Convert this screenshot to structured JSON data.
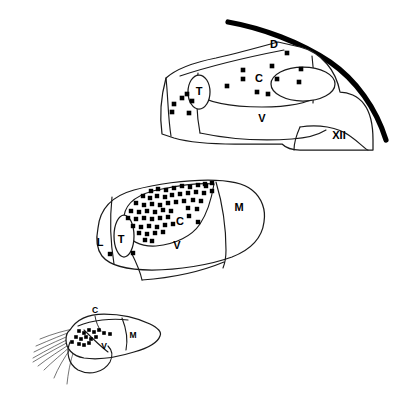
{
  "figure": {
    "background_color": "#ffffff",
    "ink_color": "#1a1a1a",
    "marker_color": "#000000",
    "marker_shape": "square",
    "caption_fragment": "____ __"
  },
  "panels": [
    {
      "id": "panel-top",
      "name": "top-panel",
      "labels": [
        {
          "text": "D",
          "x": 274,
          "y": 45,
          "size": "normal"
        },
        {
          "text": "C",
          "x": 259,
          "y": 79,
          "size": "normal"
        },
        {
          "text": "V",
          "x": 262,
          "y": 119,
          "size": "normal"
        },
        {
          "text": "T",
          "x": 199,
          "y": 92,
          "size": "normal"
        },
        {
          "text": "XII",
          "x": 339,
          "y": 136,
          "size": "normal"
        }
      ],
      "markers": [
        {
          "x": 287,
          "y": 53
        },
        {
          "x": 243,
          "y": 70
        },
        {
          "x": 272,
          "y": 66
        },
        {
          "x": 277,
          "y": 79
        },
        {
          "x": 243,
          "y": 79
        },
        {
          "x": 299,
          "y": 82
        },
        {
          "x": 257,
          "y": 92
        },
        {
          "x": 268,
          "y": 94
        },
        {
          "x": 301,
          "y": 69
        },
        {
          "x": 227,
          "y": 86
        },
        {
          "x": 192,
          "y": 101
        },
        {
          "x": 182,
          "y": 98
        },
        {
          "x": 174,
          "y": 104
        },
        {
          "x": 172,
          "y": 112
        },
        {
          "x": 189,
          "y": 113
        },
        {
          "x": 187,
          "y": 94
        }
      ]
    },
    {
      "id": "panel-middle",
      "name": "middle-panel",
      "labels": [
        {
          "text": "C",
          "x": 180,
          "y": 222,
          "size": "normal"
        },
        {
          "text": "V",
          "x": 177,
          "y": 246,
          "size": "normal"
        },
        {
          "text": "M",
          "x": 239,
          "y": 208,
          "size": "normal"
        },
        {
          "text": "L",
          "x": 100,
          "y": 243,
          "size": "normal"
        },
        {
          "text": "T",
          "x": 121,
          "y": 240,
          "size": "normal"
        }
      ],
      "markers": [
        {
          "x": 151,
          "y": 191
        },
        {
          "x": 158,
          "y": 189
        },
        {
          "x": 166,
          "y": 190
        },
        {
          "x": 174,
          "y": 188
        },
        {
          "x": 182,
          "y": 186
        },
        {
          "x": 190,
          "y": 187
        },
        {
          "x": 198,
          "y": 185
        },
        {
          "x": 206,
          "y": 186
        },
        {
          "x": 143,
          "y": 196
        },
        {
          "x": 150,
          "y": 198
        },
        {
          "x": 157,
          "y": 196
        },
        {
          "x": 165,
          "y": 197
        },
        {
          "x": 172,
          "y": 195
        },
        {
          "x": 180,
          "y": 194
        },
        {
          "x": 188,
          "y": 193
        },
        {
          "x": 196,
          "y": 192
        },
        {
          "x": 204,
          "y": 193
        },
        {
          "x": 212,
          "y": 191
        },
        {
          "x": 136,
          "y": 203
        },
        {
          "x": 144,
          "y": 205
        },
        {
          "x": 152,
          "y": 204
        },
        {
          "x": 160,
          "y": 205
        },
        {
          "x": 168,
          "y": 203
        },
        {
          "x": 176,
          "y": 202
        },
        {
          "x": 184,
          "y": 201
        },
        {
          "x": 193,
          "y": 200
        },
        {
          "x": 201,
          "y": 201
        },
        {
          "x": 131,
          "y": 211
        },
        {
          "x": 139,
          "y": 212
        },
        {
          "x": 147,
          "y": 211
        },
        {
          "x": 155,
          "y": 212
        },
        {
          "x": 163,
          "y": 210
        },
        {
          "x": 171,
          "y": 211
        },
        {
          "x": 188,
          "y": 208
        },
        {
          "x": 197,
          "y": 209
        },
        {
          "x": 128,
          "y": 218
        },
        {
          "x": 136,
          "y": 219
        },
        {
          "x": 144,
          "y": 218
        },
        {
          "x": 152,
          "y": 219
        },
        {
          "x": 160,
          "y": 218
        },
        {
          "x": 168,
          "y": 217
        },
        {
          "x": 133,
          "y": 226
        },
        {
          "x": 141,
          "y": 227
        },
        {
          "x": 149,
          "y": 226
        },
        {
          "x": 157,
          "y": 227
        },
        {
          "x": 165,
          "y": 225
        },
        {
          "x": 173,
          "y": 224
        },
        {
          "x": 139,
          "y": 233
        },
        {
          "x": 147,
          "y": 234
        },
        {
          "x": 155,
          "y": 233
        },
        {
          "x": 163,
          "y": 232
        },
        {
          "x": 145,
          "y": 240
        },
        {
          "x": 110,
          "y": 254
        },
        {
          "x": 133,
          "y": 253
        },
        {
          "x": 152,
          "y": 241
        },
        {
          "x": 205,
          "y": 184
        },
        {
          "x": 212,
          "y": 183
        },
        {
          "x": 189,
          "y": 216
        },
        {
          "x": 198,
          "y": 222
        }
      ]
    },
    {
      "id": "panel-bottom",
      "name": "bottom-panel",
      "labels": [
        {
          "text": "C",
          "x": 95,
          "y": 311,
          "size": "small"
        },
        {
          "text": "M",
          "x": 133,
          "y": 336,
          "size": "small"
        },
        {
          "text": "V",
          "x": 104,
          "y": 347,
          "size": "small"
        }
      ],
      "markers": [
        {
          "x": 79,
          "y": 331
        },
        {
          "x": 84,
          "y": 333
        },
        {
          "x": 89,
          "y": 330
        },
        {
          "x": 94,
          "y": 332
        },
        {
          "x": 99,
          "y": 330
        },
        {
          "x": 104,
          "y": 333
        },
        {
          "x": 76,
          "y": 337
        },
        {
          "x": 81,
          "y": 339
        },
        {
          "x": 86,
          "y": 337
        },
        {
          "x": 91,
          "y": 339
        },
        {
          "x": 96,
          "y": 337
        },
        {
          "x": 110,
          "y": 334
        },
        {
          "x": 79,
          "y": 344
        },
        {
          "x": 84,
          "y": 345
        },
        {
          "x": 89,
          "y": 343
        },
        {
          "x": 72,
          "y": 342
        }
      ]
    }
  ]
}
